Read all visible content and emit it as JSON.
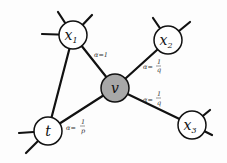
{
  "diagram": {
    "type": "graph",
    "nodes": [
      {
        "id": "x1",
        "label": "x",
        "sub": "1",
        "fill": "#ffffff"
      },
      {
        "id": "x2",
        "label": "x",
        "sub": "2",
        "fill": "#ffffff"
      },
      {
        "id": "v",
        "label": "v",
        "sub": "",
        "fill": "#a8a8a8"
      },
      {
        "id": "x3",
        "label": "x",
        "sub": "3",
        "fill": "#ffffff"
      },
      {
        "id": "t",
        "label": "t",
        "sub": "",
        "fill": "#ffffff"
      }
    ],
    "edges": [
      {
        "from": "v",
        "to": "x1",
        "label": "α=1"
      },
      {
        "from": "v",
        "to": "x2",
        "label": "α=1/q"
      },
      {
        "from": "v",
        "to": "x3",
        "label": "α=1/q"
      },
      {
        "from": "v",
        "to": "t",
        "label": "α=1/p"
      },
      {
        "from": "t",
        "to": "x1",
        "label": ""
      }
    ],
    "edge_labels": {
      "x1": "α=1",
      "x2_alpha": "α=",
      "x2_num": "1",
      "x2_den": "q",
      "x3_alpha": "α=",
      "x3_num": "1",
      "x3_den": "q",
      "t_alpha": "α=",
      "t_num": "1",
      "t_den": "p"
    }
  }
}
